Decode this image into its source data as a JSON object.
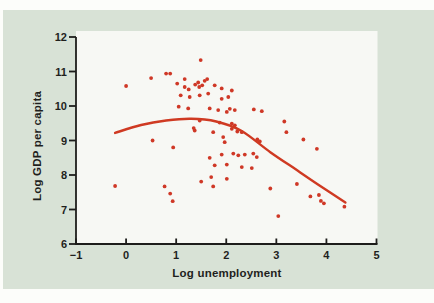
{
  "figure": {
    "page_background": "#fcfdfa",
    "panel_color": "#d8e2d6",
    "plot_background": "#f7f8f4",
    "axis_color": "#1d1d1b",
    "text_color": "#1f1f1d",
    "accent_color": "#cf3826"
  },
  "chart_data": {
    "type": "scatter",
    "title": "",
    "xlabel": "Log unemployment",
    "ylabel": "Log GDP per capita",
    "xlim": [
      -1,
      5
    ],
    "ylim": [
      6,
      12
    ],
    "x_ticks": [
      -1,
      0,
      1,
      2,
      3,
      4,
      5
    ],
    "x_tick_labels": [
      "−1",
      "0",
      "1",
      "2",
      "3",
      "4",
      "5"
    ],
    "y_ticks": [
      6,
      7,
      8,
      9,
      10,
      11,
      12
    ],
    "y_tick_labels": [
      "6",
      "7",
      "8",
      "9",
      "10",
      "11",
      "12"
    ],
    "grid": false,
    "legend": "none",
    "series": [
      {
        "name": "country-observations",
        "type": "scatter",
        "color": "#cf3826",
        "marker_radius": 1.9,
        "points": [
          [
            -0.22,
            7.68
          ],
          [
            0.0,
            10.58
          ],
          [
            0.5,
            10.81
          ],
          [
            0.53,
            9.0
          ],
          [
            0.77,
            7.67
          ],
          [
            0.8,
            10.94
          ],
          [
            0.88,
            10.94
          ],
          [
            0.88,
            7.46
          ],
          [
            0.93,
            7.24
          ],
          [
            0.94,
            8.8
          ],
          [
            1.02,
            10.65
          ],
          [
            1.05,
            9.98
          ],
          [
            1.09,
            10.31
          ],
          [
            1.17,
            10.78
          ],
          [
            1.17,
            10.55
          ],
          [
            1.24,
            9.93
          ],
          [
            1.25,
            10.48
          ],
          [
            1.27,
            10.26
          ],
          [
            1.35,
            9.36
          ],
          [
            1.37,
            9.29
          ],
          [
            1.38,
            10.62
          ],
          [
            1.44,
            10.68
          ],
          [
            1.46,
            10.55
          ],
          [
            1.47,
            10.31
          ],
          [
            1.47,
            9.58
          ],
          [
            1.49,
            11.33
          ],
          [
            1.5,
            7.81
          ],
          [
            1.52,
            10.6
          ],
          [
            1.57,
            10.73
          ],
          [
            1.62,
            10.78
          ],
          [
            1.64,
            10.36
          ],
          [
            1.67,
            9.93
          ],
          [
            1.67,
            8.5
          ],
          [
            1.7,
            7.94
          ],
          [
            1.74,
            9.24
          ],
          [
            1.74,
            7.67
          ],
          [
            1.77,
            10.6
          ],
          [
            1.77,
            8.28
          ],
          [
            1.84,
            9.88
          ],
          [
            1.87,
            9.52
          ],
          [
            1.91,
            10.51
          ],
          [
            1.91,
            10.21
          ],
          [
            1.91,
            8.59
          ],
          [
            1.94,
            9.1
          ],
          [
            1.97,
            8.95
          ],
          [
            2.01,
            9.83
          ],
          [
            2.01,
            8.3
          ],
          [
            2.01,
            7.89
          ],
          [
            2.04,
            10.26
          ],
          [
            2.07,
            9.92
          ],
          [
            2.11,
            10.45
          ],
          [
            2.11,
            9.49
          ],
          [
            2.11,
            9.34
          ],
          [
            2.14,
            8.62
          ],
          [
            2.17,
            9.88
          ],
          [
            2.17,
            9.44
          ],
          [
            2.22,
            9.26
          ],
          [
            2.24,
            8.57
          ],
          [
            2.31,
            9.24
          ],
          [
            2.31,
            8.23
          ],
          [
            2.37,
            8.59
          ],
          [
            2.51,
            8.2
          ],
          [
            2.54,
            8.62
          ],
          [
            2.55,
            9.9
          ],
          [
            2.61,
            8.52
          ],
          [
            2.62,
            9.03
          ],
          [
            2.67,
            8.97
          ],
          [
            2.71,
            9.85
          ],
          [
            2.88,
            7.61
          ],
          [
            3.04,
            6.81
          ],
          [
            3.16,
            9.55
          ],
          [
            3.2,
            9.24
          ],
          [
            3.41,
            7.74
          ],
          [
            3.54,
            9.03
          ],
          [
            3.68,
            7.38
          ],
          [
            3.81,
            8.76
          ],
          [
            3.85,
            7.42
          ],
          [
            3.89,
            7.25
          ],
          [
            3.95,
            7.18
          ],
          [
            4.36,
            7.08
          ]
        ]
      },
      {
        "name": "fitted-curve",
        "type": "line",
        "color": "#cf3a22",
        "stroke_width": 2.4,
        "points": [
          [
            -0.22,
            9.22
          ],
          [
            0.3,
            9.45
          ],
          [
            0.8,
            9.58
          ],
          [
            1.3,
            9.63
          ],
          [
            1.8,
            9.55
          ],
          [
            2.3,
            9.28
          ],
          [
            2.88,
            8.66
          ],
          [
            3.4,
            8.15
          ],
          [
            3.9,
            7.66
          ],
          [
            4.38,
            7.2
          ]
        ]
      }
    ]
  }
}
